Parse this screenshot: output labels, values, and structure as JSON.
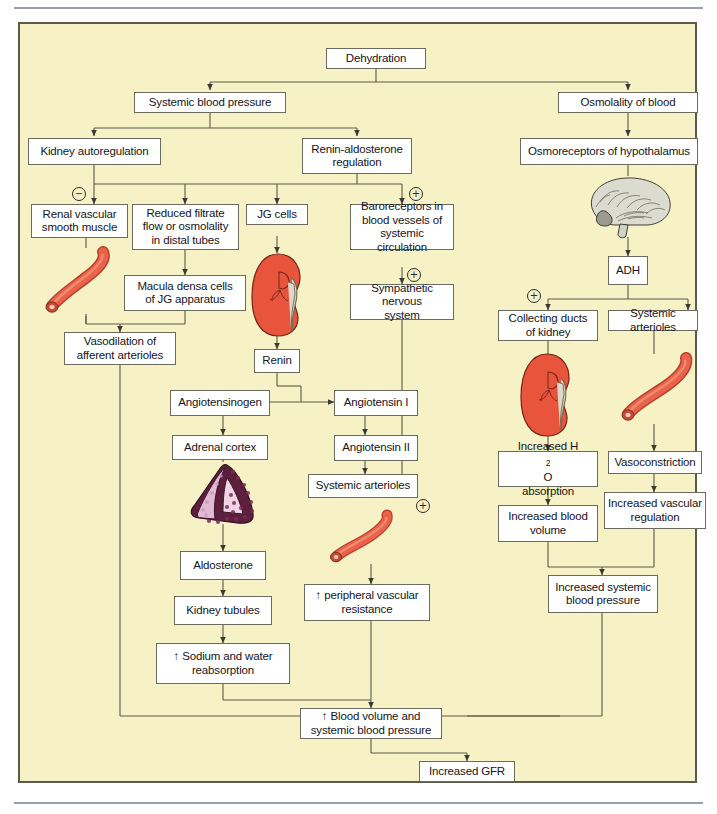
{
  "figure": {
    "panel_background": "#f6f2c6",
    "box_background": "#ffffff",
    "line_color": "#5c5a48",
    "kidney_color": "#e8543c",
    "arteriole_color": "#e06040",
    "adrenal_color": "#6d2447",
    "brain_color": "#d9d8cf"
  },
  "nodes": {
    "dehydration": "Dehydration",
    "systemic_blood_pressure": "Systemic blood pressure",
    "osmolality_of_blood": "Osmolality of blood",
    "kidney_autoregulation": "Kidney autoregulation",
    "renin_aldosterone_regulation": "Renin-aldosterone\nregulation",
    "renin_aldosterone_line1": "Renin-aldosterone",
    "renin_aldosterone_line2": "regulation",
    "osmoreceptors": "Osmoreceptors of hypothalamus",
    "renal_vascular_l1": "Renal vascular",
    "renal_vascular_l2": "smooth muscle",
    "reduced_filtrate_l1": "Reduced filtrate",
    "reduced_filtrate_l2": "flow or osmolality",
    "reduced_filtrate_l3": "in distal tubes",
    "jg_cells": "JG cells",
    "baroreceptors_l1": "Baroreceptors in",
    "baroreceptors_l2": "blood vessels of",
    "baroreceptors_l3": "systemic circulation",
    "adh": "ADH",
    "macula_densa_l1": "Macula densa cells",
    "macula_densa_l2": "of JG apparatus",
    "sympathetic_l1": "Sympathetic nervous",
    "sympathetic_l2": "system",
    "collecting_ducts_l1": "Collecting ducts",
    "collecting_ducts_l2": "of kidney",
    "systemic_arterioles_right": "Systemic arterioles",
    "vasodilation_l1": "Vasodilation of",
    "vasodilation_l2": "afferent arterioles",
    "renin": "Renin",
    "angiotensinogen": "Angiotensinogen",
    "angiotensin_i": "Angiotensin I",
    "adrenal_cortex": "Adrenal cortex",
    "angiotensin_ii": "Angiotensin II",
    "systemic_arterioles_mid": "Systemic arterioles",
    "increased_h2o_l1_pre": "Increased H",
    "increased_h2o_sub": "2",
    "increased_h2o_l1_post": "O",
    "increased_h2o_l2": "absorption",
    "vasoconstriction": "Vasoconstriction",
    "increased_blood_volume_l1": "Increased blood",
    "increased_blood_volume_l2": "volume",
    "increased_vascular_reg_l1": "Increased vascular",
    "increased_vascular_reg_l2": "regulation",
    "aldosterone": "Aldosterone",
    "peripheral_vascular_l1": "↑ peripheral vascular",
    "peripheral_vascular_l2": "resistance",
    "kidney_tubules": "Kidney tubules",
    "increased_systemic_bp_l1": "Increased systemic",
    "increased_systemic_bp_l2": "blood pressure",
    "sodium_water_l1": "↑ Sodium and water",
    "sodium_water_l2": "reabsorption",
    "blood_volume_sbp_l1": "↑ Blood volume and",
    "blood_volume_sbp_l2": "systemic blood pressure",
    "increased_gfr": "Increased GFR"
  },
  "signs": {
    "minus_kidney_autoreg": "−",
    "plus_baroreceptors": "+",
    "plus_sympathetic": "+",
    "plus_adh": "+",
    "plus_systemic_arterioles": "+"
  },
  "illustrations": {
    "arteriole_left": "arteriole-illustration",
    "kidney_jg": "kidney-illustration",
    "brain": "brain-sagittal-illustration",
    "kidney_collecting": "kidney-illustration",
    "arteriole_right": "arteriole-illustration",
    "adrenal_gland": "adrenal-gland-illustration",
    "arteriole_mid": "arteriole-illustration"
  }
}
